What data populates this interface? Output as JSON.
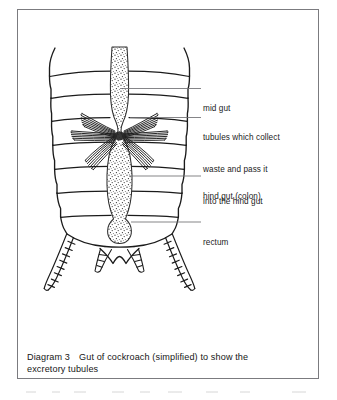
{
  "figure": {
    "title": "Gut of cockroach (simplified) to show the excretory tubules",
    "caption_number": "Diagram 3",
    "caption_text": "Gut of cockroach (simplified) to show the",
    "caption_text_line2": "excretory tubules",
    "frame_color": "#7b7b7f",
    "ink_color": "#1b1b1b",
    "leader_color": "#6f6f73",
    "background_color": "#ffffff"
  },
  "labels": [
    {
      "id": "mid-gut",
      "text": "mid gut",
      "lines": [
        "mid gut"
      ]
    },
    {
      "id": "tubules",
      "text": "tubules which collect waste and pass it into the hind gut",
      "lines": [
        "tubules which collect",
        "waste and pass it",
        "into the hind gut"
      ]
    },
    {
      "id": "hind-gut",
      "text": "hind gut (colon)",
      "lines": [
        "hind gut (colon)"
      ]
    },
    {
      "id": "rectum",
      "text": "rectum",
      "lines": [
        "rectum"
      ]
    }
  ],
  "anatomy": {
    "parts": [
      "mid gut",
      "tubules which collect waste and pass it into the hind gut",
      "hind gut (colon)",
      "rectum",
      "abdominal segments",
      "cerci"
    ],
    "segment_count": 7,
    "cerci_count": 2,
    "tubule_bundle_count": 6
  }
}
